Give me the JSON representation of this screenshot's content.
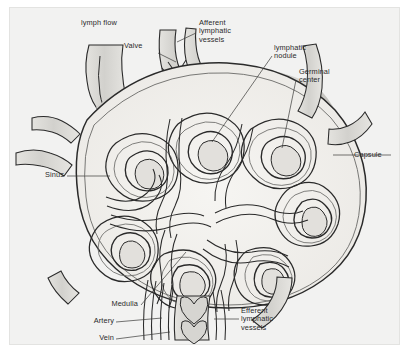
{
  "figure": {
    "kind": "anatomical-illustration",
    "background_color": "#f2f2f1",
    "ink_color": "#2a2a2a",
    "capsule_shade_color": "#c9c8c4",
    "tissue_fill_color": "#efeeea"
  },
  "labels": {
    "lymph_flow": "lymph flow",
    "valve": "Valve",
    "afferent": "Afferent\nlymphatic\nvessels",
    "nodule": "lymphatic\nnodule",
    "germinal": "Germinal\ncenter",
    "capsule": "Capsule",
    "sinus": "Sinus",
    "medulla": "Medulla",
    "artery": "Artery",
    "vein": "Vein",
    "efferent": "Efferent\nlymphatic\nvessels"
  }
}
